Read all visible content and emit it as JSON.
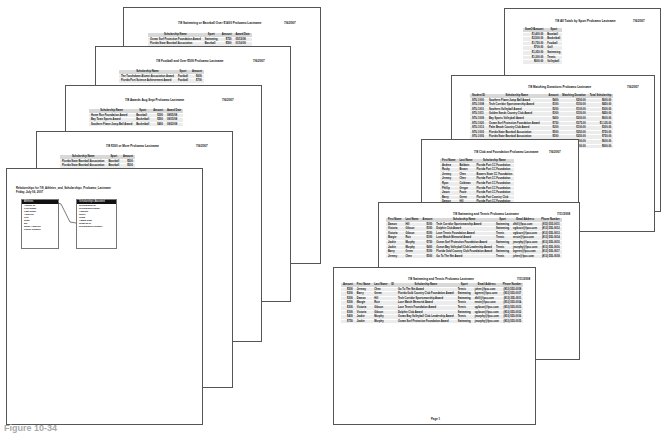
{
  "caption": "Figure 10-34",
  "left_stack": {
    "pages": [
      {
        "title": "7/8 Swimming or Baseball Over $1400 Proloamo Lastname",
        "date": "7/6/2007",
        "columns": [
          "Scholarship Name",
          "Sport",
          "Amount",
          "Award Date"
        ],
        "rows": [
          [
            "Ocean Surf Protection Foundation Award",
            "Swimming",
            "$750",
            "05/15/08"
          ],
          [
            "Florida State Baseball Association",
            "Baseball",
            "$500",
            "01/16/09"
          ]
        ]
      },
      {
        "title": "7/8 Football and Over $500 Proloamo Lastname",
        "date": "7/6/2007",
        "columns": [
          "Scholarship Name",
          "Sport",
          "Amount"
        ],
        "rows": [
          [
            "The Touchdown Alumni Association Award",
            "Football",
            "$600"
          ],
          [
            "Florida Port Science Achievement Award",
            "Football",
            "$700"
          ]
        ]
      },
      {
        "title": "7/8 Awards Aug-Sept Proloamo Lastname",
        "date": "7/6/2007",
        "columns": [
          "Scholarship Name",
          "Sport",
          "Amount",
          "Award Date"
        ],
        "rows": [
          [
            "Home Run Foundation Award",
            "Baseball",
            "$300",
            "08/05/08"
          ],
          [
            "Bay Town Sports Award",
            "Basketball",
            "$500",
            "09/15/08"
          ],
          [
            "Southern Flame Jump Ball Award",
            "Basketball",
            "$400",
            "09/22/08"
          ]
        ]
      },
      {
        "title": "7/8 $300 or More Proloamo Lastname",
        "date": "7/6/2007",
        "columns": [
          "Scholarship Name",
          "Sport",
          "Amount"
        ],
        "rows": [
          [
            "Florida State Baseball Association",
            "Baseball",
            "$500"
          ],
          [
            "Florida State Baseball Association",
            "Baseball",
            "$500"
          ]
        ]
      },
      {
        "title": "Relationships for 7/8_Athletes_and_Scholarships_Proloamo_Lastname",
        "subtitle": "Friday, July 06, 2007",
        "tables": [
          {
            "name": "Athletes",
            "fields": [
              "Athlete ID",
              "First Name",
              "Last Name",
              "Address",
              "City",
              "State",
              "ZIP",
              "Email Address",
              "Phone Number"
            ]
          },
          {
            "name": "Scholarships Awarded",
            "fields": [
              "Scholarship ID",
              "Scholarship Name",
              "Amount",
              "Sport",
              "Team",
              "Award Date",
              "Student ID",
              "Scholarship Contact"
            ]
          }
        ]
      }
    ]
  },
  "right_stack": {
    "pages": [
      {
        "title": "7/8 All Totals by Sport Proloamo Lastname",
        "date": "7/6/2007",
        "columns": [
          "SumOfAmount",
          "Sport"
        ],
        "rows": [
          [
            "$1,400.00",
            "Baseball"
          ],
          [
            "$2,500.00",
            "Basketball"
          ],
          [
            "$1,750.00",
            "Football"
          ],
          [
            "$700.00",
            "Golf"
          ],
          [
            "$1,350.00",
            "Swimming"
          ],
          [
            "$1,300.00",
            "Tennis"
          ],
          [
            "$600.00",
            "Volleyball"
          ]
        ]
      },
      {
        "title": "7/8 Matching Donations Proloamo Lastname",
        "date": "7/6/2007",
        "columns": [
          "Student ID",
          "Scholarship Name",
          "Amount",
          "Matching Donation",
          "Total Scholarship"
        ],
        "rows": [
          [
            "STU-1000",
            "Southern Flame Jump Ball Award",
            "$400",
            "$200.00",
            "$600.00"
          ],
          [
            "STU-1008",
            "Tech Corridor Sportsmanship Award",
            "$300",
            "$150.00",
            "$450.00"
          ],
          [
            "STU-1001",
            "Southern Volleyball Award",
            "$200",
            "$100.00",
            "$300.00"
          ],
          [
            "STU-1011",
            "Golden Sands Country Club Award",
            "$300",
            "$150.00",
            "$450.00"
          ],
          [
            "STU-1009",
            "Bay Sports Volleyball Award",
            "$400",
            "$200.00",
            "$600.00"
          ],
          [
            "STU-1020",
            "Ocean Surf Protection Foundation Award",
            "$750",
            "$375.00",
            "$1,125.00"
          ],
          [
            "STU-1013",
            "Palm Beach Country Club Award",
            "$200",
            "$100.00",
            "$300.00"
          ],
          [
            "STU-1003",
            "Florida State Baseball Association",
            "$500",
            "$250.00",
            "$750.00"
          ],
          [
            "STU-1005",
            "Florida State Baseball Association",
            "$500",
            "$250.00",
            "$750.00"
          ],
          [
            "STU-1010",
            "Ocean Bay Volleyball Club Leadership Award",
            "$400",
            "$200.00",
            "$600.00"
          ],
          [
            "STU-1015",
            "Jump Ball Hoops Memorial Award",
            "$600",
            "$300.00",
            "$900.00"
          ]
        ]
      },
      {
        "title": "7/8 Club and Foundation Proloamo Lastname",
        "date": "7/6/2007",
        "columns": [
          "First Name",
          "Last Name",
          "Scholarship Name"
        ],
        "rows": [
          [
            "Andrea",
            "Baldwin",
            "Florida Port CC Foundation"
          ],
          [
            "Rocky",
            "Brown",
            "Florida Port CC Foundation"
          ],
          [
            "Jeremy",
            "Chen",
            "Bowers State CC Foundation"
          ],
          [
            "Jeremy",
            "Chen",
            "Florida Port CC Foundation"
          ],
          [
            "Ryan",
            "Coldman",
            "Florida Port CC Foundation"
          ],
          [
            "Phillip",
            "Gregor",
            "Florida Port CC Foundation"
          ],
          [
            "Jason",
            "Foote",
            "Florida Port CC Foundation"
          ],
          [
            "Barry",
            "Green",
            "Florida Port Country Club"
          ],
          [
            "Damon",
            "Hill",
            "Florida Port CC Foundation"
          ],
          [
            "Damon",
            "Hill",
            "Florida Port CC Foundation"
          ]
        ]
      },
      {
        "title": "7/8 Swimming and Tennis Proloamo Lastname",
        "date": "7/11/2008",
        "columns": [
          "First Name",
          "Last Name",
          "Amount",
          "Scholarship Name",
          "Sport",
          "Email Address",
          "Phone Number"
        ],
        "rows": [
          [
            "Damon",
            "Hill",
            "$300",
            "Tech Corridor Sportsmanship Award",
            "Swimming",
            "dhill@fpcc.com",
            "(813) 555-0011"
          ],
          [
            "Victoria",
            "Gibson",
            "$300",
            "Dolphin Club Award",
            "Swimming",
            "vgibson@fpcc.com",
            "(813) 555-0012"
          ],
          [
            "Victoria",
            "Gibson",
            "$300",
            "Love Tennis Foundation Award",
            "Tennis",
            "vgibson@fpcc.com",
            "(813) 555-0013"
          ],
          [
            "Margie",
            "Ruiz",
            "$300",
            "Love Match Memorial Award",
            "Tennis",
            "mruiz@fpcc.com",
            "(813) 555-0014"
          ],
          [
            "Jackie",
            "Murphy",
            "$750",
            "Ocean Surf Protection Foundation Award",
            "Swimming",
            "jmurphy@fpcc.com",
            "(813) 555-0015"
          ],
          [
            "Jackie",
            "Murphy",
            "$400",
            "Ocean Bay Volleyball Club Leadership Award",
            "Tennis",
            "jmurphy@fpcc.com",
            "(813) 555-0016"
          ],
          [
            "Barry",
            "Green",
            "$300",
            "Florida Gold Country Club Foundation Award",
            "Swimming",
            "bgreen@fpcc.com",
            "(813) 555-0017"
          ],
          [
            "Jeremy",
            "Chen",
            "$500",
            "Go To The Net Award",
            "Tennis",
            "jchen@fpcc.com",
            "(813) 555-0018"
          ]
        ]
      },
      {
        "title": "7/8 Swimming and Tennis Proloamo Lastname",
        "date": "7/11/2008",
        "columns": [
          "Amount",
          "First Name",
          "Last Name",
          "ID",
          "Scholarship Name",
          "Sport",
          "Email Address",
          "Phone Number"
        ],
        "rows": [
          [
            "$500",
            "Jeremy",
            "Chen",
            "",
            "Go To The Net Award",
            "Tennis",
            "jchen@fpcc.com",
            "(813) 555-0018"
          ],
          [
            "$300",
            "Barry",
            "Green",
            "",
            "Florida Gold Country Club Foundation Award",
            "Swimming",
            "bgreen@fpcc.com",
            "(813) 555-0017"
          ],
          [
            "$300",
            "Damon",
            "Hill",
            "",
            "Tech Corridor Sportsmanship Award",
            "Swimming",
            "dhill@fpcc.com",
            "(813) 555-0011"
          ],
          [
            "$300",
            "Margie",
            "Ruiz",
            "",
            "Love Match Memorial Award",
            "Tennis",
            "mruiz@fpcc.com",
            "(813) 555-0014"
          ],
          [
            "$300",
            "Victoria",
            "Gibson",
            "",
            "Love Tennis Foundation Award",
            "Tennis",
            "vgibson@fpcc.com",
            "(813) 555-0013"
          ],
          [
            "$300",
            "Victoria",
            "Gibson",
            "",
            "Dolphin Club Award",
            "Swimming",
            "vgibson@fpcc.com",
            "(813) 555-0012"
          ],
          [
            "$400",
            "Jackie",
            "Murphy",
            "",
            "Ocean Bay Volleyball Club Leadership Award",
            "Tennis",
            "jmurphy@fpcc.com",
            "(813) 555-0016"
          ],
          [
            "$750",
            "Jackie",
            "Murphy",
            "",
            "Ocean Surf Protection Foundation Award",
            "Swimming",
            "jmurphy@fpcc.com",
            "(813) 555-0015"
          ]
        ],
        "footer": "Page 1"
      }
    ]
  }
}
